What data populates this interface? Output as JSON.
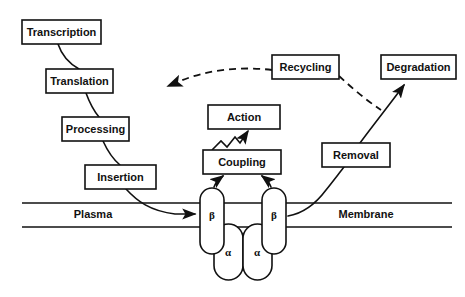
{
  "diagram": {
    "background_color": "#ffffff",
    "stroke_color": "#111111",
    "nodes": {
      "transcription": {
        "label": "Transcription",
        "x": 22,
        "y": 20,
        "w": 79,
        "h": 24
      },
      "translation": {
        "label": "Translation",
        "x": 46,
        "y": 69,
        "w": 67,
        "h": 24
      },
      "processing": {
        "label": "Processing",
        "x": 62,
        "y": 117,
        "w": 67,
        "h": 24
      },
      "insertion": {
        "label": "Insertion",
        "x": 85,
        "y": 165,
        "w": 71,
        "h": 24
      },
      "action": {
        "label": "Action",
        "x": 208,
        "y": 105,
        "w": 72,
        "h": 24
      },
      "coupling": {
        "label": "Coupling",
        "x": 203,
        "y": 150,
        "w": 78,
        "h": 24
      },
      "recycling": {
        "label": "Recycling",
        "x": 272,
        "y": 55,
        "w": 67,
        "h": 24
      },
      "degradation": {
        "label": "Degradation",
        "x": 381,
        "y": 55,
        "w": 75,
        "h": 24
      },
      "removal": {
        "label": "Removal",
        "x": 322,
        "y": 143,
        "w": 68,
        "h": 24
      }
    },
    "membrane": {
      "plasma_label": "Plasma",
      "membrane_label": "Membrane",
      "top_line_y": 203,
      "bottom_line_y": 227,
      "x_start": 22,
      "x_end": 452
    },
    "subunits": {
      "beta_left": {
        "label": "β",
        "cx": 212,
        "cy": 215
      },
      "beta_right": {
        "label": "β",
        "cx": 274,
        "cy": 215
      },
      "alpha_left": {
        "label": "α",
        "cx": 228,
        "cy": 252
      },
      "alpha_right": {
        "label": "α",
        "cx": 257,
        "cy": 252
      }
    },
    "edges": [
      {
        "name": "transcription-to-translation",
        "style": "solid"
      },
      {
        "name": "translation-to-processing",
        "style": "solid"
      },
      {
        "name": "processing-to-insertion",
        "style": "solid"
      },
      {
        "name": "insertion-to-membrane",
        "style": "solid-arrow"
      },
      {
        "name": "beta-left-to-coupling",
        "style": "solid-arrow"
      },
      {
        "name": "beta-right-to-coupling",
        "style": "solid-arrow"
      },
      {
        "name": "coupling-to-action",
        "style": "zigzag-arrow"
      },
      {
        "name": "membrane-to-removal",
        "style": "solid"
      },
      {
        "name": "removal-to-degradation",
        "style": "solid-arrow"
      },
      {
        "name": "recycling-to-degradation-link",
        "style": "dashed"
      },
      {
        "name": "recycling-to-insertion",
        "style": "dashed-arrow"
      }
    ]
  }
}
